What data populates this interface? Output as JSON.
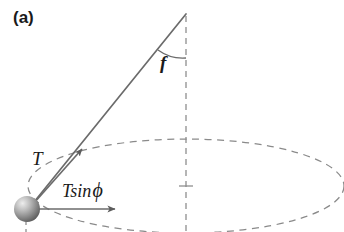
{
  "figure": {
    "panel_label": "(a)",
    "labels": {
      "tension": "T",
      "angle": "f",
      "angle_symbol_name": "phi",
      "horizontal_component_prefix": "Tsin",
      "horizontal_component_symbol": "ϕ",
      "horizontal_component_full": "Tsin ϕ"
    },
    "colors": {
      "stroke": "#6b6b6b",
      "dashed_stroke": "#8a8a8a",
      "text": "#1a1a1a",
      "sphere_light": "#e8e8e8",
      "sphere_mid": "#9a9a9a",
      "sphere_dark": "#5e5e5e",
      "background": "#ffffff"
    },
    "geometry": {
      "pivot": [
        186,
        14
      ],
      "bob": [
        28,
        209
      ],
      "tension_arrow_tip": [
        80,
        152
      ],
      "horizontal_arrow_start": [
        30,
        209
      ],
      "horizontal_arrow_tip": [
        118,
        209
      ],
      "circle_center": [
        186,
        186
      ],
      "circle_rx": 158,
      "circle_ry": 47,
      "vertical_axis_bottom": [
        186,
        232
      ]
    }
  }
}
